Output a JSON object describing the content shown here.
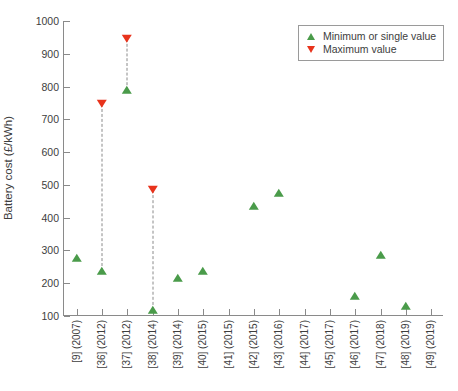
{
  "chart_data": {
    "type": "scatter",
    "title": "",
    "xlabel": "",
    "ylabel": "Battery cost (£/kWh)",
    "ylim": [
      100,
      1000
    ],
    "ytick_labels": [
      "1000",
      "900",
      "800",
      "700",
      "600",
      "500",
      "400",
      "300",
      "200",
      "100"
    ],
    "yticks": [
      1000,
      900,
      800,
      700,
      600,
      500,
      400,
      300,
      200,
      100
    ],
    "grid": false,
    "legend_position": "top-right",
    "categories": [
      "[9] (2007)",
      "[36] (2012)",
      "[37] (2012)",
      "[38] (2014)",
      "[39] (2014)",
      "[40] (2015)",
      "[41] (2015)",
      "[42] (2015)",
      "[43] (2016)",
      "[44] (2017)",
      "[45] (2017)",
      "[46] (2017)",
      "[47] (2018)",
      "[48] (2019)",
      "[49] (2019)"
    ],
    "series": [
      {
        "name": "Minimum or single value",
        "marker": "triangle-up",
        "color": "#4a9b4a",
        "values": [
          278,
          238,
          790,
          118,
          216,
          237,
          null,
          437,
          476,
          null,
          null,
          161,
          286,
          131,
          null
        ]
      },
      {
        "name": "Maximum value",
        "marker": "triangle-down",
        "color": "#e8331c",
        "values": [
          null,
          748,
          945,
          484,
          null,
          null,
          null,
          null,
          null,
          null,
          null,
          null,
          null,
          null,
          null
        ]
      }
    ],
    "connectors": [
      {
        "category": "[36] (2012)",
        "low": 238,
        "high": 748
      },
      {
        "category": "[37] (2012)",
        "low": 790,
        "high": 945
      },
      {
        "category": "[38] (2014)",
        "low": 118,
        "high": 484
      }
    ]
  },
  "legend": {
    "items": [
      {
        "label": "Minimum or single value",
        "glyph": "triangle-up-icon"
      },
      {
        "label": "Maximum value",
        "glyph": "triangle-down-icon"
      }
    ]
  },
  "colors": {
    "min_marker": "#4a9b4a",
    "max_marker": "#e8331c",
    "axis": "#8a8a8a",
    "text": "#3d3d3d",
    "background": "#ffffff"
  }
}
